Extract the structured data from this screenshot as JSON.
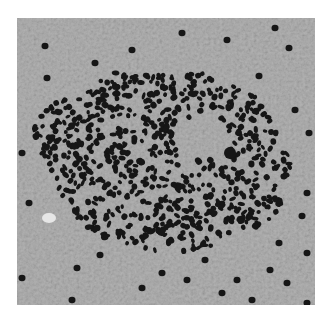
{
  "figure": {
    "type": "grayscale histology micrograph",
    "colors": {
      "background": "#ffffff",
      "tissue": "#a9a9a9",
      "tissue_light": "#c4c4c4",
      "nuclei": "#1a1a1a"
    }
  }
}
